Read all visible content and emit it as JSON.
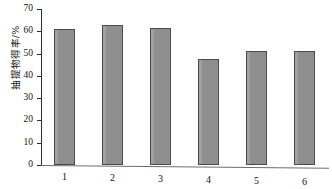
{
  "chart_data": {
    "type": "bar",
    "title": "",
    "subtitle": "",
    "xlabel": "",
    "ylabel": "抽提物得率/%",
    "categories": [
      "1",
      "2",
      "3",
      "4",
      "5",
      "6"
    ],
    "values": [
      61.0,
      63.0,
      61.5,
      47.5,
      51.3,
      51.0
    ],
    "series": [
      {
        "name": "抽提物得率",
        "values": [
          61.0,
          63.0,
          61.5,
          47.5,
          51.3,
          51.0
        ]
      }
    ],
    "ylim": [
      0,
      70
    ],
    "yticks": [
      0,
      10,
      20,
      30,
      40,
      50,
      60,
      70
    ],
    "ytick_labels": [
      "0",
      "10",
      "20",
      "30",
      "40",
      "50",
      "60",
      "70"
    ],
    "xtick_labels": [
      "1",
      "2",
      "3",
      "4",
      "5",
      "6"
    ],
    "grid": false,
    "legend": false,
    "legend_position": "none",
    "bar_color": "#8f8f8f",
    "bar_edge_color": "#4a4a4a",
    "axis_color": "#2e2e2e",
    "background_color": "#ffffff"
  }
}
